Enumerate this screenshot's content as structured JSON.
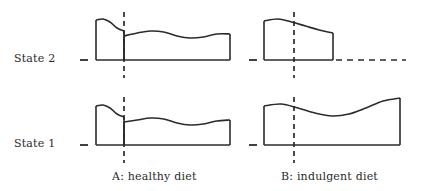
{
  "figure": {
    "background_color": "#ffffff",
    "line_color": "#2b2b2b",
    "text_color": "#2a2a2a"
  },
  "row_labels": [
    {
      "id": "state-2",
      "text": "State 2"
    },
    {
      "id": "state-1",
      "text": "State 1"
    }
  ],
  "column_labels": [
    {
      "id": "panel-a",
      "text": "A: healthy diet"
    },
    {
      "id": "panel-b",
      "text": "B: indulgent diet"
    }
  ],
  "chart_data": {
    "type": "area",
    "title": "",
    "xlabel": "",
    "ylabel": "",
    "grid": false,
    "legend": "none",
    "panels": [
      {
        "id": "state2-healthy",
        "row": "State 2",
        "column": "A: healthy diet",
        "baseline_y": 60,
        "x_start": 96,
        "x_end": 230,
        "divider_x": 124,
        "divider_style": "dashed-vertical",
        "has_trailing_dashed_baseline": false,
        "segments": [
          {
            "name": "pre-intervention",
            "x_from": 96,
            "x_to": 124,
            "profile_y": [
              20,
              19,
              22,
              28,
              31
            ],
            "description": "tall block, top curves gently downward to the right"
          },
          {
            "name": "post-intervention",
            "x_from": 124,
            "x_to": 230,
            "profile_y": [
              36,
              33,
              31,
              32,
              36,
              38,
              37,
              34,
              34
            ],
            "description": "lower undulating plateau, dips mid then rises slightly at right end"
          }
        ]
      },
      {
        "id": "state2-indulgent",
        "row": "State 2",
        "column": "B: indulgent diet",
        "baseline_y": 60,
        "x_start": 264,
        "x_end": 333,
        "divider_x": 294,
        "divider_style": "dashed-vertical",
        "has_trailing_dashed_baseline": true,
        "dashed_baseline_x_from": 336,
        "dashed_baseline_x_to": 406,
        "segments": [
          {
            "name": "continuous-block",
            "x_from": 264,
            "x_to": 333,
            "profile_y": [
              21,
              19,
              22,
              26,
              30,
              33
            ],
            "description": "single block whose top slopes steadily downward to the right, no step at the divider"
          }
        ]
      },
      {
        "id": "state1-healthy",
        "row": "State 1",
        "column": "A: healthy diet",
        "baseline_y": 145,
        "x_start": 96,
        "x_end": 230,
        "divider_x": 124,
        "divider_style": "dashed-vertical",
        "has_trailing_dashed_baseline": false,
        "segments": [
          {
            "name": "pre-intervention",
            "x_from": 96,
            "x_to": 124,
            "profile_y": [
              106,
              105,
              108,
              114,
              117
            ],
            "description": "tall block, top curves gently downward to the right"
          },
          {
            "name": "post-intervention",
            "x_from": 124,
            "x_to": 230,
            "profile_y": [
              122,
              120,
              118,
              119,
              123,
              125,
              124,
              121,
              120
            ],
            "description": "lower undulating plateau, dips mid then rises slightly at right end"
          }
        ]
      },
      {
        "id": "state1-indulgent",
        "row": "State 1",
        "column": "B: indulgent diet",
        "baseline_y": 145,
        "x_start": 264,
        "x_end": 400,
        "divider_x": 294,
        "divider_style": "dashed-vertical",
        "has_trailing_dashed_baseline": false,
        "segments": [
          {
            "name": "continuous-block",
            "x_from": 264,
            "x_to": 400,
            "profile_y": [
              106,
              104,
              108,
              113,
              116,
              114,
              108,
              101,
              98
            ],
            "description": "single block, top dips to a trough around mid-panel then climbs to its highest point at the right edge"
          }
        ]
      }
    ],
    "axis_ticks": [
      {
        "panel": "state2-healthy",
        "x_from": 80,
        "x_to": 88,
        "y": 60
      },
      {
        "panel": "state2-indulgent",
        "x_from": 249,
        "x_to": 257,
        "y": 60
      },
      {
        "panel": "state1-healthy",
        "x_from": 80,
        "x_to": 88,
        "y": 145
      },
      {
        "panel": "state1-indulgent",
        "x_from": 249,
        "x_to": 257,
        "y": 145
      }
    ]
  }
}
